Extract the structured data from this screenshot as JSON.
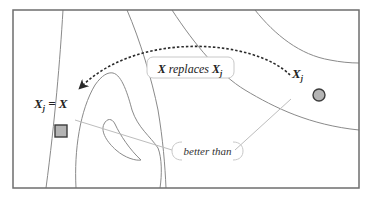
{
  "diagram": {
    "type": "contour-landscape",
    "colors": {
      "frame": "#6e6e6e",
      "contour": "#8a8a8a",
      "leader": "#bdbdbd",
      "arrow": "#2a2a2a",
      "marker_fill": "#b4b4b4",
      "marker_stroke": "#3c3c3c",
      "label_box": "#c8c8c8",
      "text": "#222222"
    },
    "labels": {
      "replaces_box": {
        "x_main": "X",
        "word": " replaces ",
        "x_sub_base": "X",
        "x_sub": "j"
      },
      "left_point": {
        "base": "X",
        "sub": "j",
        "rest": " = X"
      },
      "right_point": {
        "base": "X",
        "sub": "j"
      },
      "relation": "better than"
    },
    "markers": {
      "current_point": {
        "shape": "circle",
        "cx": 319,
        "cy": 95,
        "r": 6
      },
      "new_point": {
        "shape": "square",
        "x": 55,
        "y": 125,
        "size": 12
      }
    },
    "arrow": {
      "style": "dashed",
      "from": [
        290,
        75
      ],
      "to": [
        80,
        88
      ]
    }
  }
}
